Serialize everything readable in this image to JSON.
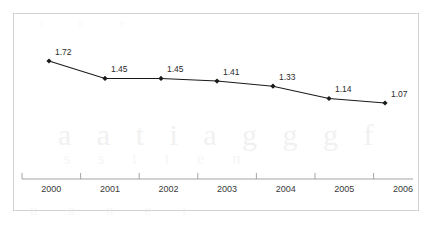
{
  "chart_data": {
    "type": "line",
    "title": "",
    "subtitle": "",
    "xlabel": "",
    "ylabel": "",
    "categories": [
      "2000",
      "2001",
      "2002",
      "2003",
      "2004",
      "2005",
      "2006"
    ],
    "values": [
      1.72,
      1.45,
      1.45,
      1.41,
      1.33,
      1.14,
      1.07
    ],
    "data_labels": [
      "1.72",
      "1.45",
      "1.45",
      "1.41",
      "1.33",
      "1.14",
      "1.07"
    ],
    "series": [
      {
        "name": "",
        "values": [
          1.72,
          1.45,
          1.45,
          1.41,
          1.33,
          1.14,
          1.07
        ]
      }
    ],
    "ylim": [
      0,
      2
    ],
    "grid": false,
    "legend": false,
    "legend_position": "none",
    "marker": "diamond",
    "line_color": "#1a1a1a",
    "marker_color": "#1a1a1a",
    "label_color": "#2b2b2b",
    "axis_color": "#9a9a9a",
    "frame_color": "#d3d3d3",
    "background_color": "#ffffff",
    "show_y_axis": false,
    "show_x_axis": true,
    "x_tick_direction": "up"
  },
  "axis": {
    "x_ticks": [
      "2000",
      "2001",
      "2002",
      "2003",
      "2004",
      "2005",
      "2006"
    ]
  },
  "labels": {
    "p0": "1.72",
    "p1": "1.45",
    "p2": "1.45",
    "p3": "1.41",
    "p4": "1.33",
    "p5": "1.14",
    "p6": "1.07"
  },
  "background_artifacts": {
    "row_a": "a a t i a g g g f",
    "row_b": "s s t t e n",
    "row_c": "u a n e t",
    "row_d": "i n e"
  }
}
